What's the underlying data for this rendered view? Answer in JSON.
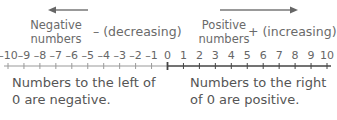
{
  "negative": {
    "label_line1": "Negative",
    "label_line2": "numbers",
    "sign": "– (decreasing)",
    "arrow_direction": "left",
    "note_line1": "Numbers to the left of",
    "note_line2": "0 are negative."
  },
  "positive": {
    "label_line1": "Positive",
    "label_line2": "numbers",
    "sign": "+ (increasing)",
    "arrow_direction": "right",
    "note_line1": "Numbers to the right",
    "note_line2": "of 0 are positive."
  },
  "number_line": {
    "ticks": [
      "–10",
      "–9",
      "–8",
      "–7",
      "–6",
      "–5",
      "–4",
      "–3",
      "–2",
      "–1",
      "0",
      "1",
      "2",
      "3",
      "4",
      "5",
      "6",
      "7",
      "8",
      "9",
      "10"
    ],
    "min": -10,
    "max": 10,
    "negative_color": "#9a9a9a",
    "positive_color": "#444444"
  }
}
